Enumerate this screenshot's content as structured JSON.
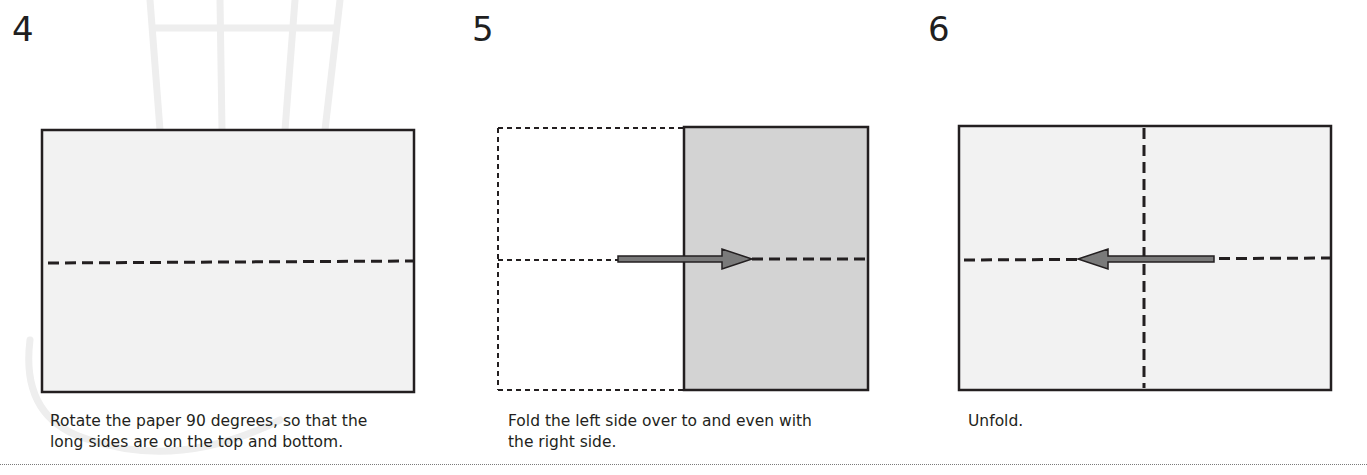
{
  "steps": [
    {
      "number": "4",
      "caption_line1": "Rotate the paper 90 degrees, so that the",
      "caption_line2": "long sides are on the top and bottom.",
      "diagram": "landscape rectangle with horizontal dashed valley-fold line across middle"
    },
    {
      "number": "5",
      "caption_line1": "Fold the left side over to and even with",
      "caption_line2": "the right side.",
      "diagram": "left half dotted outline (folded away), right half shaded gray with dashed horizontal line; arrow pointing right"
    },
    {
      "number": "6",
      "caption_line1": "Unfold.",
      "caption_line2": "",
      "diagram": "landscape rectangle with vertical and horizontal dashed crease lines; arrow pointing left"
    }
  ],
  "colors": {
    "paper_fill": "#f2f2f2",
    "folded_fill": "#d3d3d3",
    "outline": "#231f20",
    "arrow_fill": "#7a7a7a",
    "watermark": "#ececec"
  }
}
